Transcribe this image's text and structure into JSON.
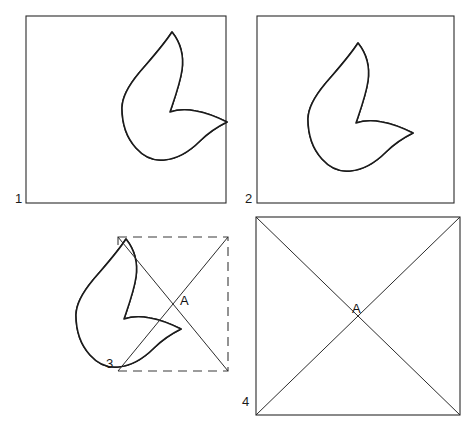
{
  "figure": {
    "background_color": "#ffffff",
    "stroke_color": "#1b1b1b",
    "hatch_color": "#4a4a4a",
    "width": 472,
    "height": 421
  },
  "panels": [
    {
      "id": "panel-1",
      "number_label": "1",
      "number_position": "bottom-left-outside",
      "frame_style": "solid",
      "frame": {
        "x": 26,
        "y": 16,
        "width": 200,
        "height": 187
      },
      "contents": "hatched-leaf-shape",
      "shape_offset": {
        "x": 0,
        "y": 0
      },
      "shape_scale": 1.0,
      "has_diagonals": false,
      "vertex_label": ""
    },
    {
      "id": "panel-2",
      "number_label": "2",
      "number_position": "bottom-left-outside",
      "frame_style": "solid",
      "frame": {
        "x": 257,
        "y": 16,
        "width": 197,
        "height": 187
      },
      "contents": "hatched-leaf-shape",
      "shape_offset": {
        "x": 186,
        "y": 11
      },
      "shape_scale": 1.0,
      "has_diagonals": false,
      "vertex_label": ""
    },
    {
      "id": "panel-3",
      "number_label": "3",
      "number_position": "bottom-left-inside",
      "frame_style": "dashed",
      "frame": {
        "x": 118,
        "y": 237,
        "width": 110,
        "height": 134
      },
      "contents": "hatched-leaf-shape-with-diagonals",
      "shape_offset": {
        "x": -46,
        "y": 207
      },
      "shape_scale": 1.0,
      "has_diagonals": true,
      "vertex_label": "A",
      "vertex_label_position": {
        "x": 180,
        "y": 303
      }
    },
    {
      "id": "panel-4",
      "number_label": "4",
      "number_position": "bottom-left-outside",
      "frame_style": "solid",
      "frame": {
        "x": 256,
        "y": 217,
        "width": 204,
        "height": 198
      },
      "contents": "empty-with-diagonals",
      "has_diagonals": true,
      "vertex_label": "A",
      "vertex_label_position": {
        "x": 352,
        "y": 312
      }
    }
  ],
  "labels": {
    "panel_1_number": "1",
    "panel_2_number": "2",
    "panel_3_number": "3",
    "panel_4_number": "4",
    "panel_3_vertex": "A",
    "panel_4_vertex": "A"
  },
  "shape": {
    "name": "hatched-leaf-shape",
    "description": "Closed curved leaf/comma figure with a tall upper lobe rising to an apex and a lower-right tail lobe, filled with vertical hatching",
    "fill_pattern": "vertical-hatch",
    "hatch_spacing_px": 3,
    "apex": {
      "x": 172,
      "y": 32
    },
    "bottom": {
      "x": 152,
      "y": 160
    },
    "right_tip": {
      "x": 227,
      "y": 122
    },
    "left_extent": {
      "x": 122,
      "y": 108
    },
    "notch": {
      "x": 170,
      "y": 112
    }
  },
  "diagonals": {
    "panel_3": {
      "line_a": {
        "x1": 118,
        "y1": 237,
        "x2": 228,
        "y2": 371
      },
      "line_b": {
        "x1": 228,
        "y1": 237,
        "x2": 118,
        "y2": 371
      },
      "intersection": {
        "x": 173,
        "y": 304
      }
    },
    "panel_4": {
      "line_a": {
        "x1": 256,
        "y1": 217,
        "x2": 460,
        "y2": 415
      },
      "line_b": {
        "x1": 460,
        "y1": 217,
        "x2": 256,
        "y2": 415
      },
      "intersection": {
        "x": 358,
        "y": 316
      }
    }
  }
}
